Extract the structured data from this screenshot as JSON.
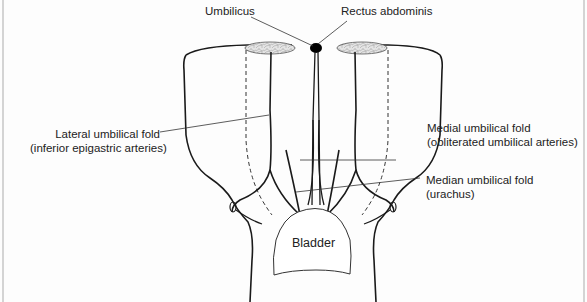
{
  "figure": {
    "labels": {
      "umbilicus": "Umbilicus",
      "rectus_abdominis": "Rectus abdominis",
      "lateral_fold": {
        "line1": "Lateral umbilical fold",
        "line2": "(inferior epigastric arteries)"
      },
      "medial_fold": {
        "line1": "Medial umbilical fold",
        "line2": "(obliterated umbilical arteries)"
      },
      "median_fold": {
        "line1": "Median umbilical fold",
        "line2": "(urachus)"
      },
      "bladder": "Bladder"
    },
    "colors": {
      "outline": "#1a1a1a",
      "leader": "#333333",
      "muscle_fill": "#e2e2e2",
      "umbilicus_fill": "#000000",
      "background": "#fdfdfd"
    }
  }
}
